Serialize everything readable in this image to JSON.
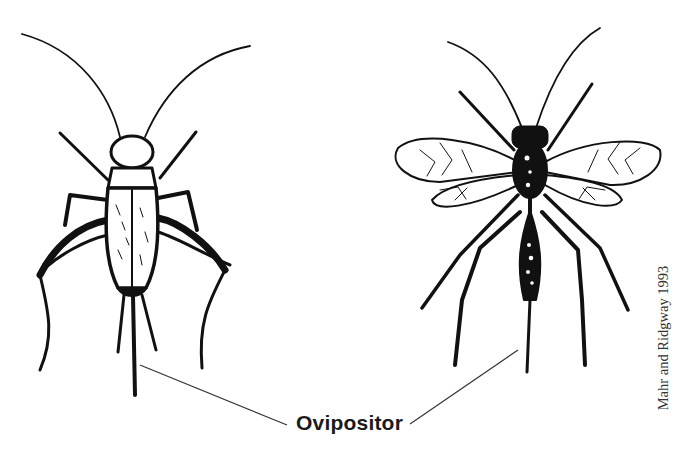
{
  "figure": {
    "subjects": [
      {
        "id": "cricket",
        "name": "Cricket",
        "position": "left"
      },
      {
        "id": "wasp",
        "name": "Parasitic wasp",
        "position": "right"
      }
    ],
    "label": "Ovipositor",
    "credit": "Mahr and Ridgway 1993",
    "colors": {
      "ink": "#111111",
      "background": "#ffffff",
      "leader_line": "#333333"
    }
  }
}
